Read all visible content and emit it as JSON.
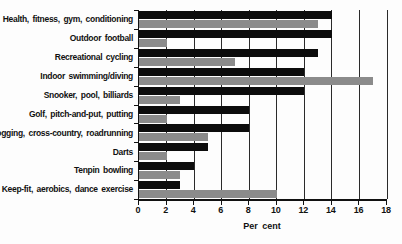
{
  "chart_data": {
    "type": "bar",
    "orientation": "horizontal",
    "title": "",
    "xlabel": "Per cent",
    "ylabel": "",
    "xlim": [
      0,
      18
    ],
    "xticks": [
      0,
      2,
      4,
      6,
      8,
      10,
      12,
      14,
      16,
      18
    ],
    "grid": "vertical gridlines at every x tick",
    "legend": "none",
    "categories": [
      "Health, fitness, gym, conditioning",
      "Outdoor football",
      "Recreational cycling",
      "Indoor swimming/diving",
      "Snooker, pool, billiards",
      "Golf, pitch-and-put, putting",
      "Jogging, cross-country, roadrunning",
      "Darts",
      "Tenpin bowling",
      "Keep-fit, aerobics, dance exercise"
    ],
    "series": [
      {
        "name": "series-black",
        "color": "#0c0c0c",
        "values": [
          14,
          14,
          13,
          12,
          12,
          8,
          8,
          5,
          4,
          3
        ]
      },
      {
        "name": "series-gray",
        "color": "#8b8b8b",
        "values": [
          13,
          2,
          7,
          17,
          3,
          2,
          5,
          2,
          3,
          10
        ]
      }
    ]
  },
  "colors": {
    "axis": "#111111",
    "gridline": "#2a2a2a",
    "background": "#fdfdfd",
    "text": "#111111"
  }
}
